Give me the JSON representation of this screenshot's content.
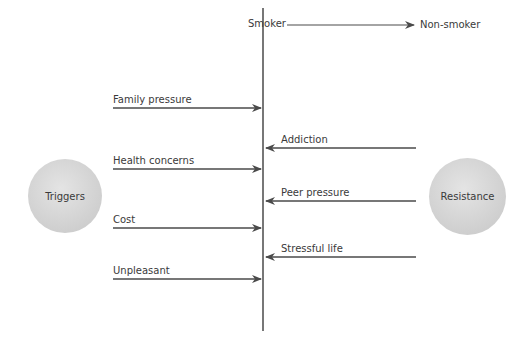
{
  "header": {
    "from": "Smoker",
    "to": "Non-smoker"
  },
  "triggers": {
    "label": "Triggers",
    "items": [
      "Family pressure",
      "Health concerns",
      "Cost",
      "Unpleasant"
    ]
  },
  "resistance": {
    "label": "Resistance",
    "items": [
      "Addiction",
      "Peer pressure",
      "Stressful life"
    ]
  },
  "colors": {
    "line": "#4a4a4a",
    "circle": "#d3d3d3"
  }
}
